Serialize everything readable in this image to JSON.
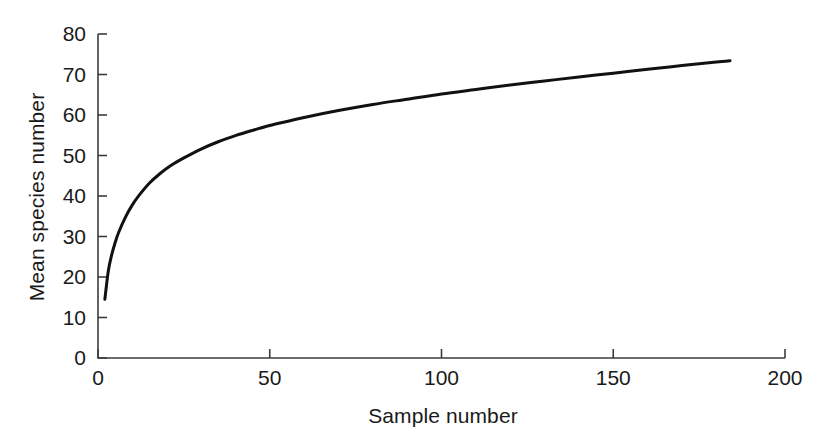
{
  "chart_data": {
    "type": "line",
    "title": "",
    "subtitle": "",
    "xlabel": "Sample number",
    "ylabel": "Mean species number",
    "xlim": [
      0,
      200
    ],
    "ylim": [
      0,
      80
    ],
    "xticks": [
      0,
      50,
      100,
      150,
      200
    ],
    "yticks": [
      0,
      10,
      20,
      30,
      40,
      50,
      60,
      70,
      80
    ],
    "xtick_labels": [
      "0",
      "50",
      "100",
      "150",
      "200"
    ],
    "ytick_labels": [
      "0",
      "10",
      "20",
      "30",
      "40",
      "50",
      "60",
      "70",
      "80"
    ],
    "grid": false,
    "legend": null,
    "legend_position": "none",
    "annotations": [],
    "series": [
      {
        "name": "Rarefaction curve",
        "color": "#111111",
        "line_width": 3,
        "x": [
          2,
          3,
          4,
          5,
          6,
          8,
          10,
          12,
          15,
          18,
          21,
          25,
          30,
          35,
          40,
          45,
          50,
          55,
          60,
          70,
          80,
          90,
          100,
          110,
          120,
          130,
          140,
          150,
          160,
          170,
          180,
          184
        ],
        "y": [
          14.5,
          21.5,
          25.5,
          28.5,
          31.0,
          34.8,
          37.8,
          40.2,
          43.2,
          45.5,
          47.4,
          49.4,
          51.6,
          53.4,
          54.9,
          56.2,
          57.4,
          58.4,
          59.4,
          61.1,
          62.6,
          63.9,
          65.2,
          66.3,
          67.4,
          68.4,
          69.4,
          70.3,
          71.3,
          72.2,
          73.1,
          73.4
        ]
      }
    ]
  },
  "axes": {
    "axis_color": "#3c3c3c",
    "axis_line_width": 1.6,
    "tick_length": 9,
    "tick_direction": "inward"
  },
  "figure": {
    "background": "#ffffff"
  }
}
